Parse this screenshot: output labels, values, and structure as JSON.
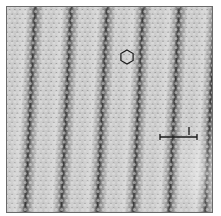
{
  "image": {
    "kind": "STM micrograph of hexagonal atomic lattice with moire stripes",
    "background": "#ffffff",
    "panel": {
      "x": 6,
      "y": 6,
      "w": 207,
      "h": 207,
      "border": "#6a6a6a",
      "base": "#a8a8a8"
    },
    "stripes": {
      "dark_color": "#3a3a3a",
      "light_color": "#d8d8d8",
      "period_px": 36,
      "tilt_px": 10,
      "dark_centers_x_top": [
        28,
        64,
        101,
        137,
        172,
        205
      ]
    },
    "lattice": {
      "spacing_px": 5.2,
      "dot_light": "#e2e2e2",
      "dot_dark": "#6e6e6e"
    }
  },
  "annotations": {
    "hexagon": {
      "cx": 127,
      "cy": 57,
      "r": 7,
      "stroke": "#1a1a1a"
    },
    "scale_bar": {
      "x1": 160,
      "x2": 197,
      "y": 137,
      "tick_x": 189,
      "tick_y1": 127,
      "tick_y2": 135,
      "stroke": "#1a1a1a"
    }
  }
}
